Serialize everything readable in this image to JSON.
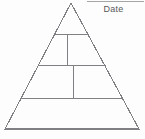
{
  "worksheet": {
    "name": "blank-pyramid-worksheet",
    "background_color": "#fdfdfd",
    "line_color": "#808084",
    "date_field": {
      "label": "Date",
      "rule_visible": true
    },
    "pyramid": {
      "name": "food-pyramid-outline",
      "tier_count": 4,
      "apex": {
        "x": 71,
        "y": 3
      },
      "base_left": {
        "x": 5,
        "y": 129
      },
      "base_right": {
        "x": 139,
        "y": 129
      },
      "outline": "M71,3 L139,129 L5,129 Z",
      "dividers": [
        {
          "name": "tier-divider-1",
          "y": 34,
          "x1": 55,
          "x2": 88
        },
        {
          "name": "tier-divider-2",
          "y": 65,
          "x1": 39,
          "x2": 105
        },
        {
          "name": "tier-divider-3",
          "y": 98,
          "x1": 22,
          "x2": 122
        }
      ],
      "splitters": [
        {
          "name": "tier-2-vertical-split",
          "x": 67,
          "y1": 34,
          "y2": 65
        },
        {
          "name": "tier-3-vertical-split",
          "x": 73,
          "y1": 65,
          "y2": 98
        }
      ],
      "cells": [
        {
          "name": "tier-1-apex-cell",
          "label": ""
        },
        {
          "name": "tier-2-left-cell",
          "label": ""
        },
        {
          "name": "tier-2-right-cell",
          "label": ""
        },
        {
          "name": "tier-3-left-cell",
          "label": ""
        },
        {
          "name": "tier-3-right-cell",
          "label": ""
        },
        {
          "name": "tier-4-base-cell",
          "label": ""
        }
      ]
    }
  }
}
